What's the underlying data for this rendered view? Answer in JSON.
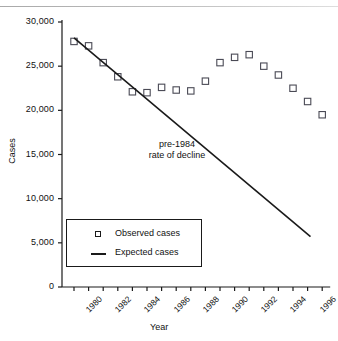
{
  "chart_data": {
    "type": "scatter",
    "title": "",
    "xlabel": "Year",
    "ylabel": "Cases",
    "xlim": [
      1979.5,
      1997.5
    ],
    "ylim": [
      0,
      30000
    ],
    "grid": false,
    "legend_position": "lower-left",
    "y_ticks": [
      0,
      5000,
      10000,
      15000,
      20000,
      25000,
      30000
    ],
    "y_tick_labels": [
      "0",
      "5,000",
      "10,000",
      "15,000",
      "20,000",
      "25,000",
      "30,000"
    ],
    "x_ticks": [
      1980,
      1981,
      1982,
      1983,
      1984,
      1985,
      1986,
      1987,
      1988,
      1989,
      1990,
      1991,
      1992,
      1993,
      1994,
      1995,
      1996,
      1997
    ],
    "x_tick_labels": [
      "1980",
      "",
      "1982",
      "",
      "1984",
      "",
      "1986",
      "",
      "1988",
      "",
      "1990",
      "",
      "1992",
      "",
      "1994",
      "",
      "1996",
      ""
    ],
    "annotations": [
      {
        "text_line1": "pre-1984",
        "text_line2": "rate of decline",
        "x": 1988,
        "y": 15500
      }
    ],
    "series": [
      {
        "name": "Observed cases",
        "type": "scatter",
        "marker": "open-square",
        "x": [
          1980,
          1981,
          1982,
          1983,
          1984,
          1985,
          1986,
          1987,
          1988,
          1989,
          1990,
          1991,
          1992,
          1993,
          1994,
          1995,
          1996,
          1997
        ],
        "values": [
          27800,
          27300,
          25400,
          23800,
          22100,
          22000,
          22600,
          22300,
          22200,
          23300,
          25400,
          26000,
          26300,
          25000,
          24000,
          22500,
          21000,
          19500
        ]
      },
      {
        "name": "Expected cases",
        "type": "line",
        "x": [
          1980,
          1996.2
        ],
        "values": [
          28200,
          5700
        ]
      }
    ]
  },
  "legend": {
    "items": [
      {
        "label": "Observed cases",
        "marker": "open-square"
      },
      {
        "label": "Expected cases",
        "marker": "line"
      }
    ]
  }
}
